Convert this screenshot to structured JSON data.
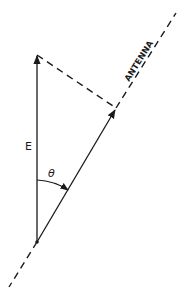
{
  "diagram": {
    "labels": {
      "vector": "E",
      "angle": "θ",
      "antenna": "ANTENNA"
    },
    "colors": {
      "line": "#1a1a1a",
      "background": "#ffffff"
    }
  }
}
